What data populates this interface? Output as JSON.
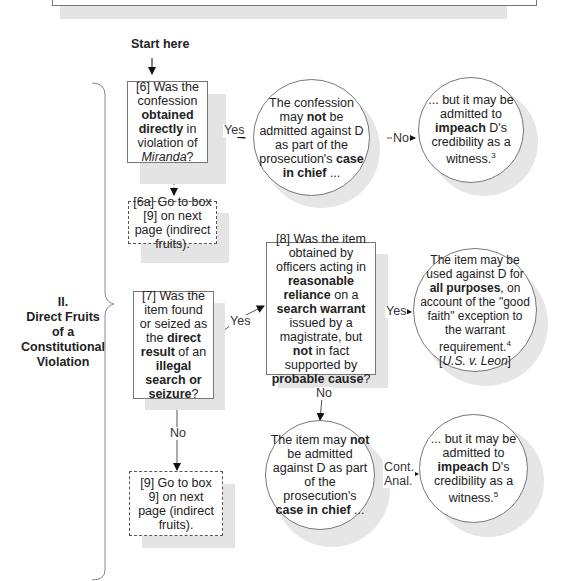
{
  "start_label": "Start here",
  "section": {
    "numeral": "II.",
    "title_lines": [
      "Direct Fruits",
      "of a",
      "Constitutional",
      "Violation"
    ]
  },
  "nodes": {
    "q6": {
      "id": "[6]",
      "pre": "Was the confession ",
      "b1": "obtained directly",
      "mid": " in violation of ",
      "italic": "Miranda",
      "post": "?"
    },
    "q6a": {
      "text": "[6a] Go to box [9] on next page (indirect fruits)."
    },
    "c6_yes": {
      "pre": "The confession may ",
      "b1": "not",
      "mid": " be admitted against D as part of the prosecution's ",
      "b2": "case in chief",
      "post": " ..."
    },
    "c6_no": {
      "pre": "... but it may be admitted to ",
      "b1": "impeach",
      "mid": " D's credibility as a witness.",
      "sup": "3"
    },
    "q7": {
      "id": "[7]",
      "pre": "Was the item found or seized as the ",
      "b1": "direct result",
      "mid": " of an ",
      "b2": "illegal search or seizure",
      "post": "?"
    },
    "q8": {
      "id": "[8]",
      "pre": "Was the item obtained by officers acting in ",
      "b1": "reasonable reliance",
      "mid1": " on a ",
      "b2": "search warrant",
      "mid2": " issued by a magistrate, but ",
      "b3": "not",
      "mid3": " in fact supported by ",
      "b4": "probable cause",
      "post": "?"
    },
    "c8_yes": {
      "pre": "The item may be used against D for ",
      "b1": "all purposes",
      "mid": ", on account of the \"good faith\" exception to the warrant requirement.",
      "sup": "4",
      "cite": "U.S. v. Leon"
    },
    "c8_no": {
      "pre": "The item may ",
      "b1": "not",
      "mid": " be admitted against D as part of the prosecution's ",
      "b2": "case in chief",
      "post": " ..."
    },
    "c8_impeach": {
      "pre": "... but it may be admitted to ",
      "b1": "impeach",
      "mid": " D's credibility as a witness.",
      "sup": "5"
    },
    "q9": {
      "text": "[9] Go to box 9] on next page (indirect fruits)."
    }
  },
  "edges": {
    "q6_yes": "Yes",
    "c6_no": "No",
    "q7_yes": "Yes",
    "q8_yes": "Yes",
    "q8_no": "No",
    "q7_no": "No",
    "cont_anal_1": "Cont.",
    "cont_anal_2": "Anal."
  }
}
